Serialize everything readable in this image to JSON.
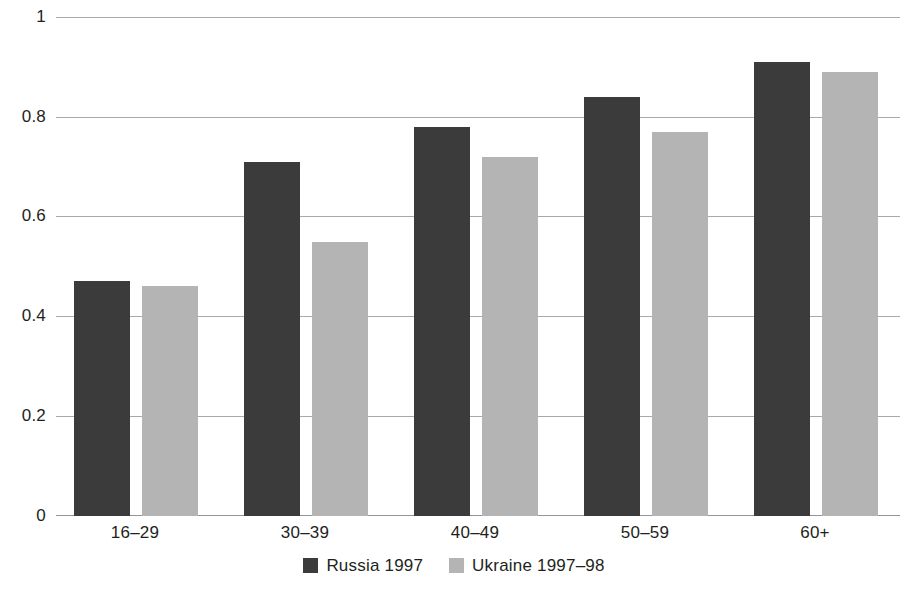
{
  "chart_data": {
    "type": "bar",
    "title": "",
    "subtitle": "",
    "xlabel": "",
    "ylabel": "",
    "categories": [
      "16–29",
      "30–39",
      "40–49",
      "50–59",
      "60+"
    ],
    "series": [
      {
        "name": "Russia 1997",
        "color": "#3b3b3b",
        "values": [
          0.47,
          0.71,
          0.78,
          0.84,
          0.91
        ]
      },
      {
        "name": "Ukraine 1997–98",
        "color": "#b4b4b4",
        "values": [
          0.46,
          0.55,
          0.72,
          0.77,
          0.89
        ]
      }
    ],
    "ylim": [
      0,
      1
    ],
    "yticks": [
      0,
      0.2,
      0.4,
      0.6,
      0.8,
      1
    ],
    "ytick_labels": [
      "0",
      "0.2",
      "0.4",
      "0.6",
      "0.8",
      "1"
    ],
    "grid": true,
    "grid_axis": "y",
    "grid_color": "#a7a9ac",
    "legend_position": "bottom-center",
    "background_color": "#ffffff",
    "bar_orientation": "vertical"
  }
}
